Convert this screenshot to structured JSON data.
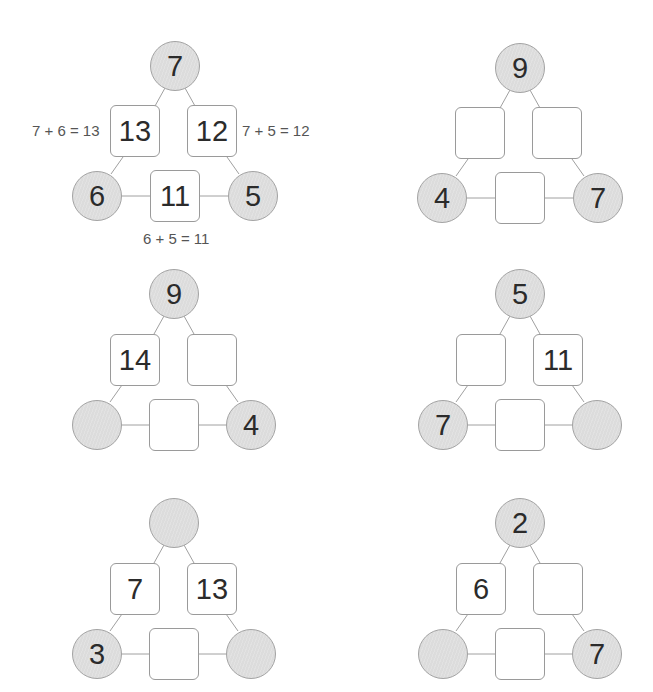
{
  "worksheet": {
    "example": {
      "top": "7",
      "left_box": "13",
      "right_box": "12",
      "bottom_left": "6",
      "bottom_right": "5",
      "bottom_box": "11",
      "eq_left": "7 + 6 = 13",
      "eq_right": "7 + 5 = 12",
      "eq_bottom": "6 + 5 = 11"
    },
    "puzzles": [
      {
        "top": "9",
        "left_box": "",
        "right_box": "",
        "bottom_left": "4",
        "bottom_right": "7",
        "bottom_box": ""
      },
      {
        "top": "9",
        "left_box": "14",
        "right_box": "",
        "bottom_left": "",
        "bottom_right": "4",
        "bottom_box": ""
      },
      {
        "top": "5",
        "left_box": "",
        "right_box": "11",
        "bottom_left": "7",
        "bottom_right": "",
        "bottom_box": ""
      },
      {
        "top": "",
        "left_box": "7",
        "right_box": "13",
        "bottom_left": "3",
        "bottom_right": "",
        "bottom_box": ""
      },
      {
        "top": "2",
        "left_box": "6",
        "right_box": "",
        "bottom_left": "",
        "bottom_right": "7",
        "bottom_box": ""
      }
    ]
  },
  "colors": {
    "circle_fill": "#dcdcdc",
    "circle_border": "#a3a3a3",
    "box_border": "#9a9a9a",
    "line": "#a0a0a0",
    "number_text": "#2b2b2b",
    "equation_text": "#555555"
  }
}
